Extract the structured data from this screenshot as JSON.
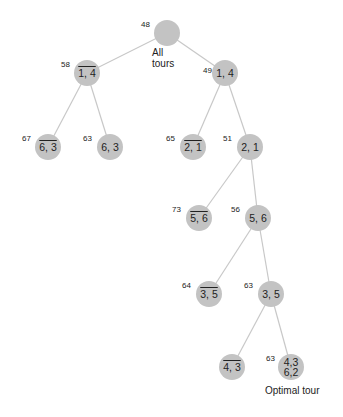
{
  "diagram": {
    "type": "branch-and-bound search tree",
    "node_color": "#c3c3c3",
    "edge_color": "#c8c8c8",
    "nodes": [
      {
        "id": "root",
        "label": "",
        "bound": "48",
        "caption": "All tours",
        "negated": false,
        "x": 167,
        "y": 33
      },
      {
        "id": "n1l",
        "label": "1, 4",
        "bound": "58",
        "negated": true,
        "x": 87,
        "y": 73
      },
      {
        "id": "n1r",
        "label": "1, 4",
        "bound": "49",
        "negated": false,
        "x": 225,
        "y": 73
      },
      {
        "id": "n2a",
        "label": "6, 3",
        "bound": "67",
        "negated": true,
        "x": 48,
        "y": 147
      },
      {
        "id": "n2b",
        "label": "6, 3",
        "bound": "63",
        "negated": false,
        "x": 110,
        "y": 147
      },
      {
        "id": "n2c",
        "label": "2, 1",
        "bound": "65",
        "negated": true,
        "x": 193,
        "y": 147
      },
      {
        "id": "n2d",
        "label": "2, 1",
        "bound": "51",
        "negated": false,
        "x": 250,
        "y": 147
      },
      {
        "id": "n3l",
        "label": "5, 6",
        "bound": "73",
        "negated": true,
        "x": 199,
        "y": 218
      },
      {
        "id": "n3r",
        "label": "5, 6",
        "bound": "56",
        "negated": false,
        "x": 258,
        "y": 218
      },
      {
        "id": "n4l",
        "label": "3, 5",
        "bound": "64",
        "negated": true,
        "x": 209,
        "y": 294
      },
      {
        "id": "n4r",
        "label": "3, 5",
        "bound": "63",
        "negated": false,
        "x": 271,
        "y": 294
      },
      {
        "id": "n5l",
        "label": "4, 3",
        "bound": "",
        "negated": true,
        "x": 232,
        "y": 367
      },
      {
        "id": "n5r",
        "label": "4,3",
        "label2": "6,2",
        "bound": "63",
        "negated": false,
        "x": 291,
        "y": 367,
        "caption": "Optimal tour"
      }
    ],
    "edges": [
      [
        "root",
        "n1l"
      ],
      [
        "root",
        "n1r"
      ],
      [
        "n1l",
        "n2a"
      ],
      [
        "n1l",
        "n2b"
      ],
      [
        "n1r",
        "n2c"
      ],
      [
        "n1r",
        "n2d"
      ],
      [
        "n2d",
        "n3l"
      ],
      [
        "n2d",
        "n3r"
      ],
      [
        "n3r",
        "n4l"
      ],
      [
        "n3r",
        "n4r"
      ],
      [
        "n4r",
        "n5l"
      ],
      [
        "n4r",
        "n5r"
      ]
    ],
    "root_caption_line1": "All",
    "root_caption_line2": "tours",
    "optimal_caption": "Optimal tour"
  }
}
